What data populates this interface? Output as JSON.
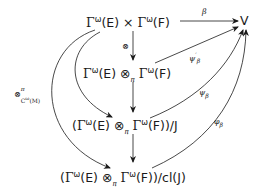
{
  "diagram": {
    "nodes": {
      "product": "Γ^ω(E) × Γ^ω(F)",
      "v": "V",
      "tensor": "Γ^ω(E) ⊗_π Γ^ω(F)",
      "quotient_j": "(Γ^ω(E) ⊗_π Γ^ω(F))/J",
      "quotient_cl_j": "(Γ^ω(E) ⊗_π Γ^ω(F))/cl(J)"
    },
    "node_parts": {
      "gamma": "Γ",
      "omega": "ω",
      "e": "(E)",
      "f": "(F)",
      "times": " × ",
      "otimes": " ⊗",
      "pi": "π",
      "open": "(",
      "close_j": ")/J",
      "close_cl": ")/cl(J)",
      "v": "V"
    },
    "edges": [
      {
        "from": "product",
        "to": "v",
        "label": "β"
      },
      {
        "from": "product",
        "to": "tensor",
        "label": "⊗"
      },
      {
        "from": "tensor",
        "to": "v",
        "label": "ψ'_β"
      },
      {
        "from": "tensor",
        "to": "quotient_j",
        "label": ""
      },
      {
        "from": "product",
        "to": "quotient_j",
        "label": ""
      },
      {
        "from": "quotient_j",
        "to": "v",
        "label": "ψ_β"
      },
      {
        "from": "quotient_j",
        "to": "quotient_cl_j",
        "label": ""
      },
      {
        "from": "product",
        "to": "quotient_cl_j",
        "label": "⊗^π_{C^ω(M)}"
      },
      {
        "from": "quotient_cl_j",
        "to": "v",
        "label": "φ_β"
      }
    ],
    "labels": {
      "beta": "β",
      "otimes": "⊗",
      "psi_prime": "ψ",
      "prime": "′",
      "beta_sub": "β",
      "psi": "ψ",
      "phi": "φ",
      "otimes_pi": "⊗",
      "pi_sup": "π",
      "c_omega_m": "C",
      "omega_sup": "ω",
      "m": "(M)"
    }
  }
}
